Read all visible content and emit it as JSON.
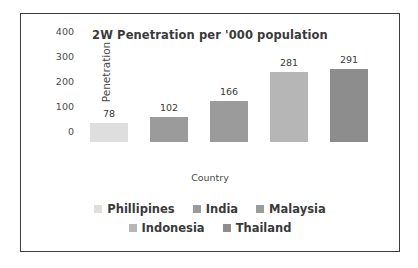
{
  "chart_data": {
    "type": "bar",
    "title": "2W Penetration per '000 population",
    "xlabel": "Country",
    "ylabel": "Penetration",
    "categories": [
      "Phillipines",
      "India",
      "Malaysia",
      "Indonesia",
      "Thailand"
    ],
    "values": [
      78,
      102,
      166,
      281,
      291
    ],
    "value_labels": [
      "78",
      "102",
      "166",
      "281",
      "291"
    ],
    "yticks": [
      400,
      300,
      200,
      100,
      0
    ],
    "ytick_labels": [
      "400",
      "300",
      "200",
      "100",
      "0"
    ],
    "ylim": [
      0,
      400
    ],
    "grid": false,
    "legend_position": "bottom",
    "series_colors": [
      "#dedede",
      "#9b9b9b",
      "#9b9b9b",
      "#b6b6b6",
      "#8d8d8d"
    ],
    "legend": [
      {
        "label": "Phillipines",
        "color": "#dedede"
      },
      {
        "label": "India",
        "color": "#9b9b9b"
      },
      {
        "label": "Malaysia",
        "color": "#9b9b9b"
      },
      {
        "label": "Indonesia",
        "color": "#b6b6b6"
      },
      {
        "label": "Thailand",
        "color": "#8d8d8d"
      }
    ],
    "legend_rows": [
      [
        0,
        1,
        2
      ],
      [
        3,
        4
      ]
    ]
  },
  "style": {
    "border_color": "#3d3d3d",
    "text_color": "#3a3a3a",
    "background": "#ffffff"
  }
}
